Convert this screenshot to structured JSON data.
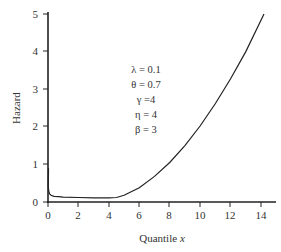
{
  "chart_data": {
    "type": "line",
    "title": "",
    "xlabel": "Quantile x",
    "ylabel": "Hazard",
    "xlim": [
      0,
      15
    ],
    "ylim": [
      0,
      5
    ],
    "xticks": [
      0,
      2,
      4,
      6,
      8,
      10,
      12,
      14
    ],
    "yticks": [
      0,
      1,
      2,
      3,
      4,
      5
    ],
    "grid": false,
    "legend": null,
    "annotations": [
      "λ = 0.1",
      "θ = 0.7",
      "γ =4",
      "η = 4",
      "β = 3"
    ],
    "series": [
      {
        "name": "Hazard",
        "x": [
          0.02,
          0.05,
          0.1,
          0.2,
          0.4,
          0.7,
          1,
          2,
          3,
          4,
          4.5,
          5,
          6,
          7,
          8,
          9,
          10,
          11,
          12,
          13,
          14.2
        ],
        "y": [
          0.4,
          0.28,
          0.22,
          0.18,
          0.15,
          0.14,
          0.13,
          0.12,
          0.11,
          0.11,
          0.12,
          0.18,
          0.38,
          0.68,
          1.05,
          1.5,
          2.02,
          2.62,
          3.28,
          4.0,
          5.0
        ]
      }
    ]
  },
  "axes": {
    "x_label_main": "Quantile ",
    "x_label_var": "x",
    "y_label": "Hazard",
    "x_tick_labels": [
      "0",
      "2",
      "4",
      "6",
      "8",
      "10",
      "12",
      "14"
    ],
    "y_tick_labels": [
      "0",
      "1",
      "2",
      "3",
      "4",
      "5"
    ]
  },
  "params": {
    "lambda": "λ = 0.1",
    "theta": "θ = 0.7",
    "gamma": "γ =4",
    "eta": "η = 4",
    "beta": "β = 3"
  },
  "colors": {
    "line": "#222222",
    "axis": "#222222",
    "text": "#333333"
  }
}
